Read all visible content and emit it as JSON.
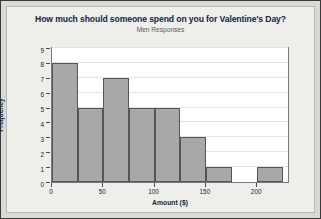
{
  "chart_data": {
    "type": "bar",
    "title": "How much should someone spend on you for Valentine's Day?",
    "subtitle": "Men Responses",
    "xlabel": "Amount ($)",
    "ylabel": "Frequency",
    "bin_width": 25,
    "bin_starts": [
      0,
      25,
      50,
      75,
      100,
      125,
      150,
      175,
      200
    ],
    "categories": [
      "0-25",
      "25-50",
      "50-75",
      "75-100",
      "100-125",
      "125-150",
      "150-175",
      "175-200",
      "200-225"
    ],
    "values": [
      8,
      5,
      7,
      5,
      5,
      3,
      1,
      0,
      1
    ],
    "xlim": [
      0,
      230
    ],
    "ylim": [
      0,
      9
    ],
    "xticks": [
      0,
      50,
      100,
      150,
      200
    ],
    "xtick_labels": [
      "0",
      "50",
      "100",
      "150",
      "200"
    ],
    "yticks": [
      0,
      1,
      2,
      3,
      4,
      5,
      6,
      7,
      8,
      9
    ],
    "ytick_labels": [
      "0",
      "1",
      "2",
      "3",
      "4",
      "5",
      "6",
      "7",
      "8",
      "9"
    ],
    "grid": true,
    "grid_axis": "y",
    "legend": false,
    "bar_color": "#a8a8a8",
    "bar_edge_color": "#555555",
    "plot_background": "#ffffff",
    "page_background": "#eeeeeb",
    "title_color": "#14253f"
  }
}
